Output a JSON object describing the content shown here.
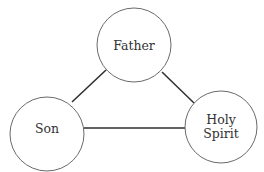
{
  "diagram": {
    "type": "triangle-relationship",
    "nodes": [
      {
        "id": "father",
        "label_lines": [
          "Father"
        ],
        "cx": 134,
        "cy": 45,
        "r": 37
      },
      {
        "id": "son",
        "label_lines": [
          "Son"
        ],
        "cx": 47,
        "cy": 134,
        "r": 37
      },
      {
        "id": "holy-spirit",
        "label_lines": [
          "Holy",
          "Spirit"
        ],
        "cx": 221,
        "cy": 127,
        "r": 36
      }
    ],
    "edges": [
      {
        "from": "son",
        "to": "father"
      },
      {
        "from": "father",
        "to": "holy-spirit"
      },
      {
        "from": "son",
        "to": "holy-spirit"
      }
    ],
    "colors": {
      "background": "#ffffff",
      "circle_stroke": "#6a6a6a",
      "edge_stroke": "#2e2e2e",
      "text": "#333333"
    }
  },
  "labels": {
    "father": "Father",
    "son": "Son",
    "holy_spirit_line1": "Holy",
    "holy_spirit_line2": "Spirit"
  }
}
